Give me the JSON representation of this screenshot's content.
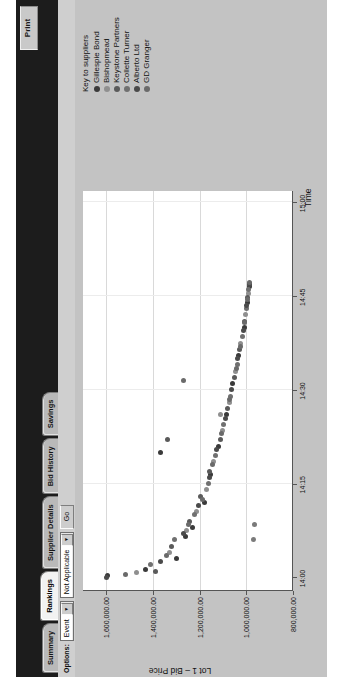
{
  "window": {
    "print_label": "Print"
  },
  "tabs": [
    {
      "label": "Summary",
      "active": false
    },
    {
      "label": "Rankings",
      "active": true
    },
    {
      "label": "Supplier Details",
      "active": false
    },
    {
      "label": "Bid History",
      "active": false
    },
    {
      "label": "Savings",
      "active": false
    }
  ],
  "options_bar": {
    "label": "Options:",
    "scope_select": {
      "value": "Event"
    },
    "filter_select": {
      "value": "Not Applicable"
    },
    "go_label": "Go"
  },
  "legend": {
    "title": "Key to suppliers",
    "items": [
      {
        "label": "Gillespie Bond",
        "color": "#3a3a3a"
      },
      {
        "label": "Bishopmead",
        "color": "#8f8f8f"
      },
      {
        "label": "Keystone Partners",
        "color": "#5a5a5a"
      },
      {
        "label": "Collette Turner",
        "color": "#707070"
      },
      {
        "label": "Alberto Ltd",
        "color": "#4a4a4a"
      },
      {
        "label": "GD Granger",
        "color": "#6a6a6a"
      }
    ]
  },
  "chart_data": {
    "type": "scatter",
    "title": "",
    "xlabel": "Time",
    "ylabel": "Lot 1 – Bid Price",
    "xtick_labels": [
      "14:00",
      "14:15",
      "14:30",
      "14:45",
      "15:00"
    ],
    "xtick_values": [
      840,
      855,
      870,
      885,
      900
    ],
    "xlim": [
      838,
      902
    ],
    "ytick_labels": [
      "800,000.00",
      "1,000,000.00",
      "1,200,000.00",
      "1,400,000.00",
      "1,600,000.00"
    ],
    "ytick_values": [
      800000,
      1000000,
      1200000,
      1400000,
      1600000
    ],
    "ylim": [
      800000,
      1700000
    ],
    "grid": true,
    "legend_position": "right",
    "series": [
      {
        "name": "Gillespie Bond",
        "color": "#3a3a3a",
        "points": [
          [
            840.3,
            1596000
          ],
          [
            841.2,
            1432000
          ],
          [
            843.0,
            1298000
          ],
          [
            846.5,
            1262000
          ],
          [
            848.0,
            1231000
          ],
          [
            852.0,
            1180000
          ],
          [
            856.5,
            1152000
          ],
          [
            861.0,
            1120000
          ],
          [
            866.0,
            1086000
          ],
          [
            871.0,
            1058000
          ],
          [
            875.5,
            1032000
          ],
          [
            880.0,
            1010000
          ],
          [
            884.0,
            996000
          ],
          [
            886.5,
            988000
          ]
        ]
      },
      {
        "name": "Bishopmead",
        "color": "#8f8f8f",
        "points": [
          [
            840.8,
            1470000
          ],
          [
            844.0,
            1330000
          ],
          [
            847.5,
            1255000
          ],
          [
            850.5,
            1214000
          ],
          [
            854.0,
            1170000
          ],
          [
            858.5,
            1140000
          ],
          [
            863.5,
            1104000
          ],
          [
            868.0,
            1074000
          ],
          [
            873.0,
            1046000
          ],
          [
            877.5,
            1024000
          ],
          [
            882.0,
            1004000
          ],
          [
            885.5,
            992000
          ]
        ]
      },
      {
        "name": "Keystone Partners",
        "color": "#5a5a5a",
        "points": [
          [
            841.0,
            1390000
          ],
          [
            845.0,
            1322000
          ],
          [
            849.0,
            1244000
          ],
          [
            853.0,
            1196000
          ],
          [
            857.0,
            1158000
          ],
          [
            862.0,
            1112000
          ],
          [
            867.0,
            1080000
          ],
          [
            872.0,
            1052000
          ],
          [
            876.5,
            1028000
          ],
          [
            881.0,
            1008000
          ],
          [
            884.8,
            994000
          ],
          [
            887.0,
            986000
          ]
        ]
      },
      {
        "name": "Collette Turner",
        "color": "#707070",
        "points": [
          [
            842.0,
            1410000
          ],
          [
            846.0,
            1306000
          ],
          [
            850.0,
            1222000
          ],
          [
            855.0,
            1164000
          ],
          [
            859.5,
            1132000
          ],
          [
            864.5,
            1096000
          ],
          [
            869.0,
            1068000
          ],
          [
            874.0,
            1040000
          ],
          [
            878.5,
            1018000
          ],
          [
            883.0,
            1000000
          ],
          [
            886.0,
            990000
          ]
        ]
      },
      {
        "name": "Alberto Ltd",
        "color": "#4a4a4a",
        "points": [
          [
            840.0,
            1598000
          ],
          [
            842.6,
            1368000
          ],
          [
            847.0,
            1270000
          ],
          [
            851.5,
            1206000
          ],
          [
            856.0,
            1160000
          ],
          [
            860.5,
            1126000
          ],
          [
            865.5,
            1090000
          ],
          [
            870.0,
            1062000
          ],
          [
            875.0,
            1036000
          ],
          [
            879.5,
            1014000
          ],
          [
            883.5,
            998000
          ],
          [
            886.8,
            987000
          ]
        ]
      },
      {
        "name": "GD Granger",
        "color": "#6a6a6a",
        "points": [
          [
            840.5,
            1520000
          ],
          [
            843.5,
            1344000
          ],
          [
            848.5,
            1248000
          ],
          [
            852.5,
            1190000
          ],
          [
            858.0,
            1146000
          ],
          [
            863.0,
            1108000
          ],
          [
            868.5,
            1072000
          ],
          [
            873.5,
            1044000
          ],
          [
            877.0,
            1026000
          ],
          [
            880.8,
            1009000
          ],
          [
            884.4,
            995000
          ],
          [
            887.2,
            985000
          ]
        ]
      }
    ],
    "outliers": [
      {
        "x": 860.0,
        "y": 1368000,
        "color": "#3a3a3a"
      },
      {
        "x": 862.0,
        "y": 1336000,
        "color": "#5a5a5a"
      },
      {
        "x": 866.0,
        "y": 1112000,
        "color": "#8f8f8f"
      },
      {
        "x": 846.0,
        "y": 968000,
        "color": "#7a7a7a"
      },
      {
        "x": 848.5,
        "y": 966000,
        "color": "#7a7a7a"
      },
      {
        "x": 871.5,
        "y": 1268000,
        "color": "#6a6a6a"
      }
    ]
  }
}
